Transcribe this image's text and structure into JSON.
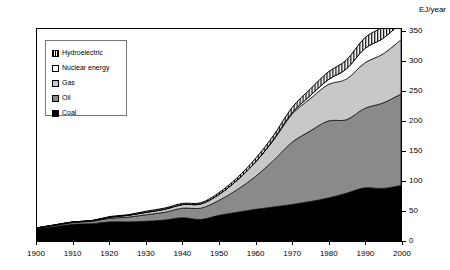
{
  "axis": {
    "unit_label": "EJ/year",
    "y_ticks": [
      0,
      50,
      100,
      150,
      200,
      250,
      300,
      350
    ],
    "x_ticks": [
      1900,
      1910,
      1920,
      1930,
      1940,
      1950,
      1960,
      1970,
      1980,
      1990,
      2000
    ]
  },
  "legend": {
    "items": [
      {
        "label": "Hydroelectric",
        "swatch": "hatched-square-icon",
        "color": "#ffffff"
      },
      {
        "label": "Nuclear energy",
        "swatch": "white-square-icon",
        "color": "#ffffff"
      },
      {
        "label": "Gas",
        "swatch": "light-gray-square-icon",
        "color": "#c8c8c8"
      },
      {
        "label": "Oil",
        "swatch": "dark-gray-square-icon",
        "color": "#8a8a8a"
      },
      {
        "label": "Coal",
        "swatch": "black-square-icon",
        "color": "#000000"
      }
    ]
  },
  "chart_data": {
    "type": "area",
    "title": "",
    "xlabel": "",
    "ylabel": "EJ/year",
    "xlim": [
      1900,
      2000
    ],
    "ylim": [
      0,
      350
    ],
    "grid": false,
    "legend_position": "upper-left",
    "stacked": true,
    "x": [
      1900,
      1905,
      1910,
      1915,
      1920,
      1925,
      1930,
      1935,
      1940,
      1945,
      1950,
      1955,
      1960,
      1965,
      1970,
      1975,
      1980,
      1985,
      1990,
      1995,
      2000
    ],
    "series": [
      {
        "name": "Coal",
        "color": "#000000",
        "values": [
          21,
          24,
          28,
          29,
          32,
          32,
          33,
          35,
          39,
          36,
          43,
          48,
          53,
          57,
          61,
          66,
          72,
          80,
          89,
          88,
          93
        ]
      },
      {
        "name": "Oil",
        "color": "#8a8a8a",
        "values": [
          1,
          2,
          3,
          4,
          6,
          8,
          11,
          13,
          16,
          19,
          25,
          38,
          55,
          78,
          104,
          118,
          129,
          123,
          133,
          143,
          153
        ]
      },
      {
        "name": "Gas",
        "color": "#c8c8c8",
        "values": [
          0,
          1,
          1,
          1,
          2,
          3,
          4,
          5,
          6,
          7,
          10,
          16,
          24,
          34,
          47,
          54,
          61,
          68,
          76,
          82,
          91
        ]
      },
      {
        "name": "Nuclear energy",
        "color": "#ffffff",
        "values": [
          0,
          0,
          0,
          0,
          0,
          0,
          0,
          0,
          0,
          0,
          0,
          0,
          0,
          1,
          2,
          5,
          8,
          17,
          24,
          26,
          28
        ]
      },
      {
        "name": "Hydroelectric",
        "color": "#ffffff",
        "values": [
          0,
          0,
          0,
          0,
          1,
          1,
          2,
          2,
          2,
          2,
          3,
          4,
          6,
          7,
          9,
          11,
          13,
          15,
          18,
          20,
          22
        ]
      }
    ],
    "totals": [
      22,
      27,
      32,
      34,
      41,
      44,
      50,
      55,
      63,
      64,
      81,
      106,
      138,
      177,
      223,
      254,
      283,
      303,
      340,
      359,
      387
    ]
  }
}
